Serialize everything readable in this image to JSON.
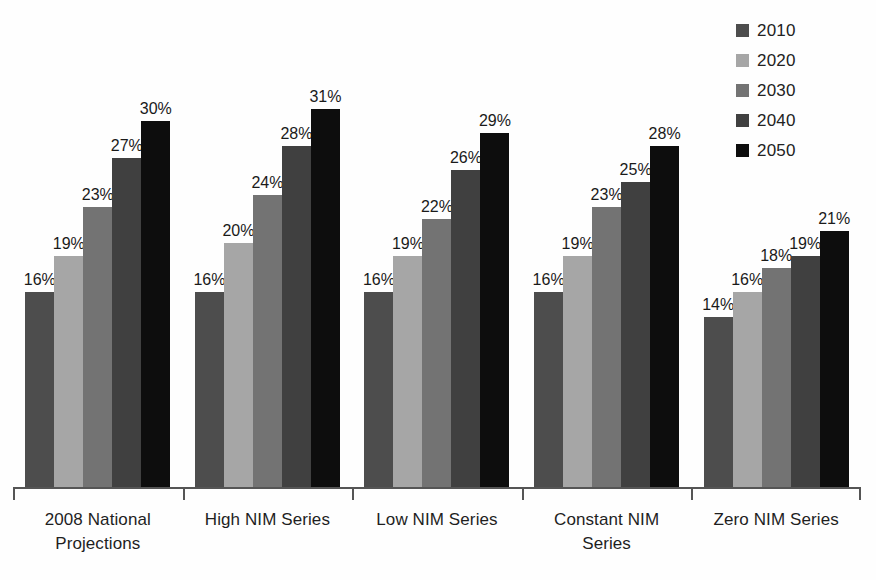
{
  "chart_data": {
    "type": "bar",
    "title": "",
    "subtitle": "",
    "xlabel": "",
    "ylabel": "",
    "grid": false,
    "legend_position": "top-right",
    "ylim": [
      0,
      35
    ],
    "categories": [
      "2008 National Projections",
      "High NIM Series",
      "Low NIM Series",
      "Constant NIM Series",
      "Zero NIM Series"
    ],
    "category_lines": [
      [
        "2008 National",
        "Projections"
      ],
      [
        "High NIM Series"
      ],
      [
        "Low NIM Series"
      ],
      [
        "Constant NIM",
        "Series"
      ],
      [
        "Zero NIM Series"
      ]
    ],
    "series": [
      {
        "name": "2010",
        "color": "#4d4d4d",
        "values": [
          16,
          16,
          16,
          16,
          14
        ],
        "labels": [
          "16%",
          "16%",
          "16%",
          "16%",
          "14%"
        ]
      },
      {
        "name": "2020",
        "color": "#a6a6a6",
        "values": [
          19,
          20,
          19,
          19,
          16
        ],
        "labels": [
          "19%",
          "20%",
          "19%",
          "19%",
          "16%"
        ]
      },
      {
        "name": "2030",
        "color": "#737373",
        "values": [
          23,
          24,
          22,
          23,
          18
        ],
        "labels": [
          "23%",
          "24%",
          "22%",
          "23%",
          "18%"
        ]
      },
      {
        "name": "2040",
        "color": "#404040",
        "values": [
          27,
          28,
          26,
          25,
          19
        ],
        "labels": [
          "27%",
          "28%",
          "26%",
          "25%",
          "19%"
        ]
      },
      {
        "name": "2050",
        "color": "#0d0d0d",
        "values": [
          30,
          31,
          29,
          28,
          21
        ],
        "labels": [
          "30%",
          "31%",
          "29%",
          "28%",
          "21%"
        ]
      }
    ]
  },
  "legend": {
    "items": [
      {
        "label": "2010",
        "color": "#4d4d4d"
      },
      {
        "label": "2020",
        "color": "#a6a6a6"
      },
      {
        "label": "2030",
        "color": "#737373"
      },
      {
        "label": "2040",
        "color": "#404040"
      },
      {
        "label": "2050",
        "color": "#0d0d0d"
      }
    ]
  },
  "axis": {
    "line_color": "#555555",
    "tick_count": 6
  }
}
